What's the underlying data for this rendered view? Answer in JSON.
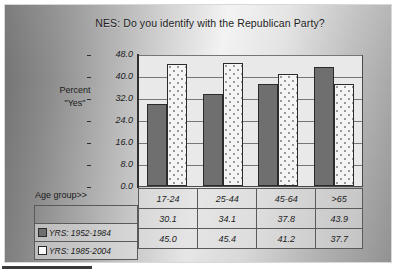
{
  "slide": {
    "title": "NES:  Do you identify with the Republican Party?",
    "axis_label_line1": "Percent",
    "axis_label_line2": "\"Yes\"",
    "age_group_label": "Age group>>"
  },
  "chart_data": {
    "type": "bar",
    "title": "NES:  Do you identify with the Republican Party?",
    "xlabel": "Age group>>",
    "ylabel": "Percent \"Yes\"",
    "categories": [
      "17-24",
      "25-44",
      "45-64",
      ">65"
    ],
    "series": [
      {
        "name": "YRS: 1952-1984",
        "values": [
          30.1,
          34.1,
          37.8,
          43.9
        ],
        "color": "#6f6f6f",
        "fill": "solid"
      },
      {
        "name": "YRS: 1985-2004",
        "values": [
          45.0,
          45.4,
          41.2,
          37.7
        ],
        "color": "#f4f4f4",
        "fill": "dotted"
      }
    ],
    "ylim": [
      0.0,
      48.0
    ],
    "ytick_values": [
      48.0,
      40.0,
      32.0,
      24.0,
      16.0,
      8.0,
      0.0
    ],
    "ytick_labels": [
      "48.0",
      "40.0",
      "32.0",
      "24.0",
      "16.0",
      "8.0",
      "0.0"
    ],
    "grid": true,
    "legend_position": "data-table-left"
  },
  "table": {
    "header_label": "Age group>>",
    "columns": [
      "17-24",
      "25-44",
      "45-64",
      ">65"
    ],
    "rows": [
      {
        "label": "YRS: 1952-1984",
        "swatch": "filled-dark-square",
        "values": [
          "30.1",
          "34.1",
          "37.8",
          "43.9"
        ]
      },
      {
        "label": "YRS: 1985-2004",
        "swatch": "empty-white-square",
        "values": [
          "45.0",
          "45.4",
          "41.2",
          "37.7"
        ]
      }
    ]
  }
}
